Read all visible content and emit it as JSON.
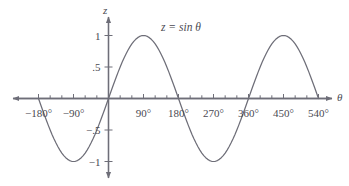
{
  "figure": {
    "equation_label": "z = sin θ",
    "x_axis_name": "θ",
    "y_axis_name": "z",
    "curve_color": "#6e6e78",
    "axis_color": "#6e6e78",
    "text_color": "#4a4a52",
    "background": "#ffffff"
  },
  "chart_data": {
    "type": "line",
    "title": "",
    "subtitle": "",
    "annotation": "z = sin θ",
    "xlabel": "θ",
    "ylabel": "z",
    "xlim": [
      -205,
      575
    ],
    "ylim": [
      -1.25,
      1.25
    ],
    "grid": false,
    "legend": "none",
    "x_tick_labels": [
      "−180°",
      "−90°",
      "90°",
      "180°",
      "270°",
      "360°",
      "450°",
      "540°"
    ],
    "x_tick_values": [
      -180,
      -90,
      90,
      180,
      270,
      360,
      450,
      540
    ],
    "x_minor_tick_step": 30,
    "y_tick_labels": [
      "1",
      ".5",
      "−.5",
      "−1"
    ],
    "y_tick_values": [
      1,
      0.5,
      -0.5,
      -1
    ],
    "series": [
      {
        "name": "z = sin θ",
        "x_start": -180,
        "x_end": 540,
        "x_step": 5,
        "amplitude": 1,
        "period": 360,
        "phase": 0,
        "key_points": [
          {
            "x": -180,
            "y": 0
          },
          {
            "x": -90,
            "y": -1
          },
          {
            "x": 0,
            "y": 0
          },
          {
            "x": 90,
            "y": 1
          },
          {
            "x": 180,
            "y": 0
          },
          {
            "x": 270,
            "y": -1
          },
          {
            "x": 360,
            "y": 0
          },
          {
            "x": 450,
            "y": 1
          },
          {
            "x": 540,
            "y": 0
          }
        ]
      }
    ]
  },
  "labels": {
    "x_ticks": [
      {
        "text": "−180°",
        "value": -180
      },
      {
        "text": "−90°",
        "value": -90
      },
      {
        "text": "90°",
        "value": 90
      },
      {
        "text": "180°",
        "value": 180
      },
      {
        "text": "270°",
        "value": 270
      },
      {
        "text": "360°",
        "value": 360
      },
      {
        "text": "450°",
        "value": 450
      },
      {
        "text": "540°",
        "value": 540
      }
    ],
    "y_ticks": [
      {
        "text": "1",
        "value": 1
      },
      {
        "text": ".5",
        "value": 0.5
      },
      {
        "text": "−.5",
        "value": -0.5
      },
      {
        "text": "−1",
        "value": -1
      }
    ]
  }
}
